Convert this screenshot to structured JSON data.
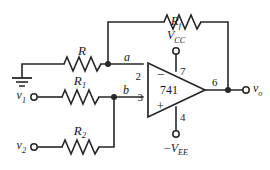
{
  "figure": {
    "kind": "circuit-schematic",
    "width": 270,
    "height": 170,
    "background": "#ffffff",
    "wire_color": "#262626",
    "text_color": "#1a1a1a"
  },
  "opamp": {
    "part_number": "741",
    "inverting_sign": "−",
    "noninverting_sign": "+",
    "pins": {
      "inverting_input": "2",
      "noninverting_input": "3",
      "positive_supply": "7",
      "negative_supply": "4",
      "output": "6"
    }
  },
  "nodes": {
    "inverting_node": "a",
    "noninverting_node": "b"
  },
  "components": {
    "feedback_resistor": {
      "base": "R",
      "subscript": "f"
    },
    "input_resistor_inverting": {
      "base": "R",
      "subscript": ""
    },
    "input_resistor_1": {
      "base": "R",
      "subscript": "1"
    },
    "input_resistor_2": {
      "base": "R",
      "subscript": "2"
    }
  },
  "terminals": {
    "source_1": {
      "base": "v",
      "subscript": "1"
    },
    "source_2": {
      "base": "v",
      "subscript": "2"
    },
    "output": {
      "base": "v",
      "subscript": "o"
    },
    "supply_positive": {
      "base": "V",
      "subscript": "CC",
      "prefix": ""
    },
    "supply_negative": {
      "base": "V",
      "subscript": "EE",
      "prefix": "−"
    },
    "ground": "ground"
  }
}
